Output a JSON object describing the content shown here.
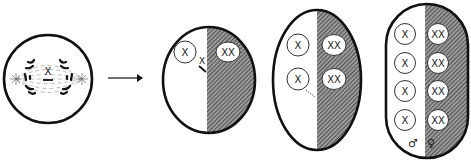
{
  "diagram": {
    "type": "cell-division-gynandromorph",
    "stages": [
      {
        "id": "mitosis-cell",
        "label_center": "X"
      },
      {
        "id": "two-cell",
        "left_nuclei": [
          "X"
        ],
        "right_nuclei": [
          "XX"
        ],
        "lost_chromosome": "X"
      },
      {
        "id": "four-cell",
        "left_nuclei": [
          "X",
          "X"
        ],
        "right_nuclei": [
          "XX",
          "XX"
        ]
      },
      {
        "id": "eight-cell",
        "left_nuclei": [
          "X",
          "X",
          "X",
          "X"
        ],
        "right_nuclei": [
          "XX",
          "XX",
          "XX",
          "XX"
        ],
        "left_symbol": "♂",
        "right_symbol": "♀"
      }
    ],
    "arrow": "→",
    "colors": {
      "outline": "#111111",
      "hatch": "#555555",
      "background": "#ffffff"
    }
  }
}
